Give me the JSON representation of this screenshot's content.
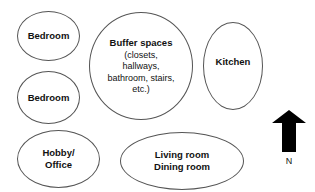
{
  "diagram": {
    "rooms": {
      "bedroom_1": {
        "title": "Bedroom"
      },
      "bedroom_2": {
        "title": "Bedroom"
      },
      "buffer": {
        "title": "Buffer spaces",
        "details": [
          "(closets,",
          "hallways,",
          "bathroom, stairs,",
          "etc.)"
        ]
      },
      "kitchen": {
        "title": "Kitchen"
      },
      "hobby": {
        "title_lines": [
          "Hobby/",
          "Office"
        ]
      },
      "living": {
        "title_lines": [
          "Living room",
          "Dining room"
        ]
      }
    },
    "compass": {
      "icon": "north-arrow-icon",
      "label": "N",
      "color": "#000000"
    },
    "colors": {
      "outline": "#555555",
      "text": "#111111",
      "background": "#ffffff"
    }
  }
}
